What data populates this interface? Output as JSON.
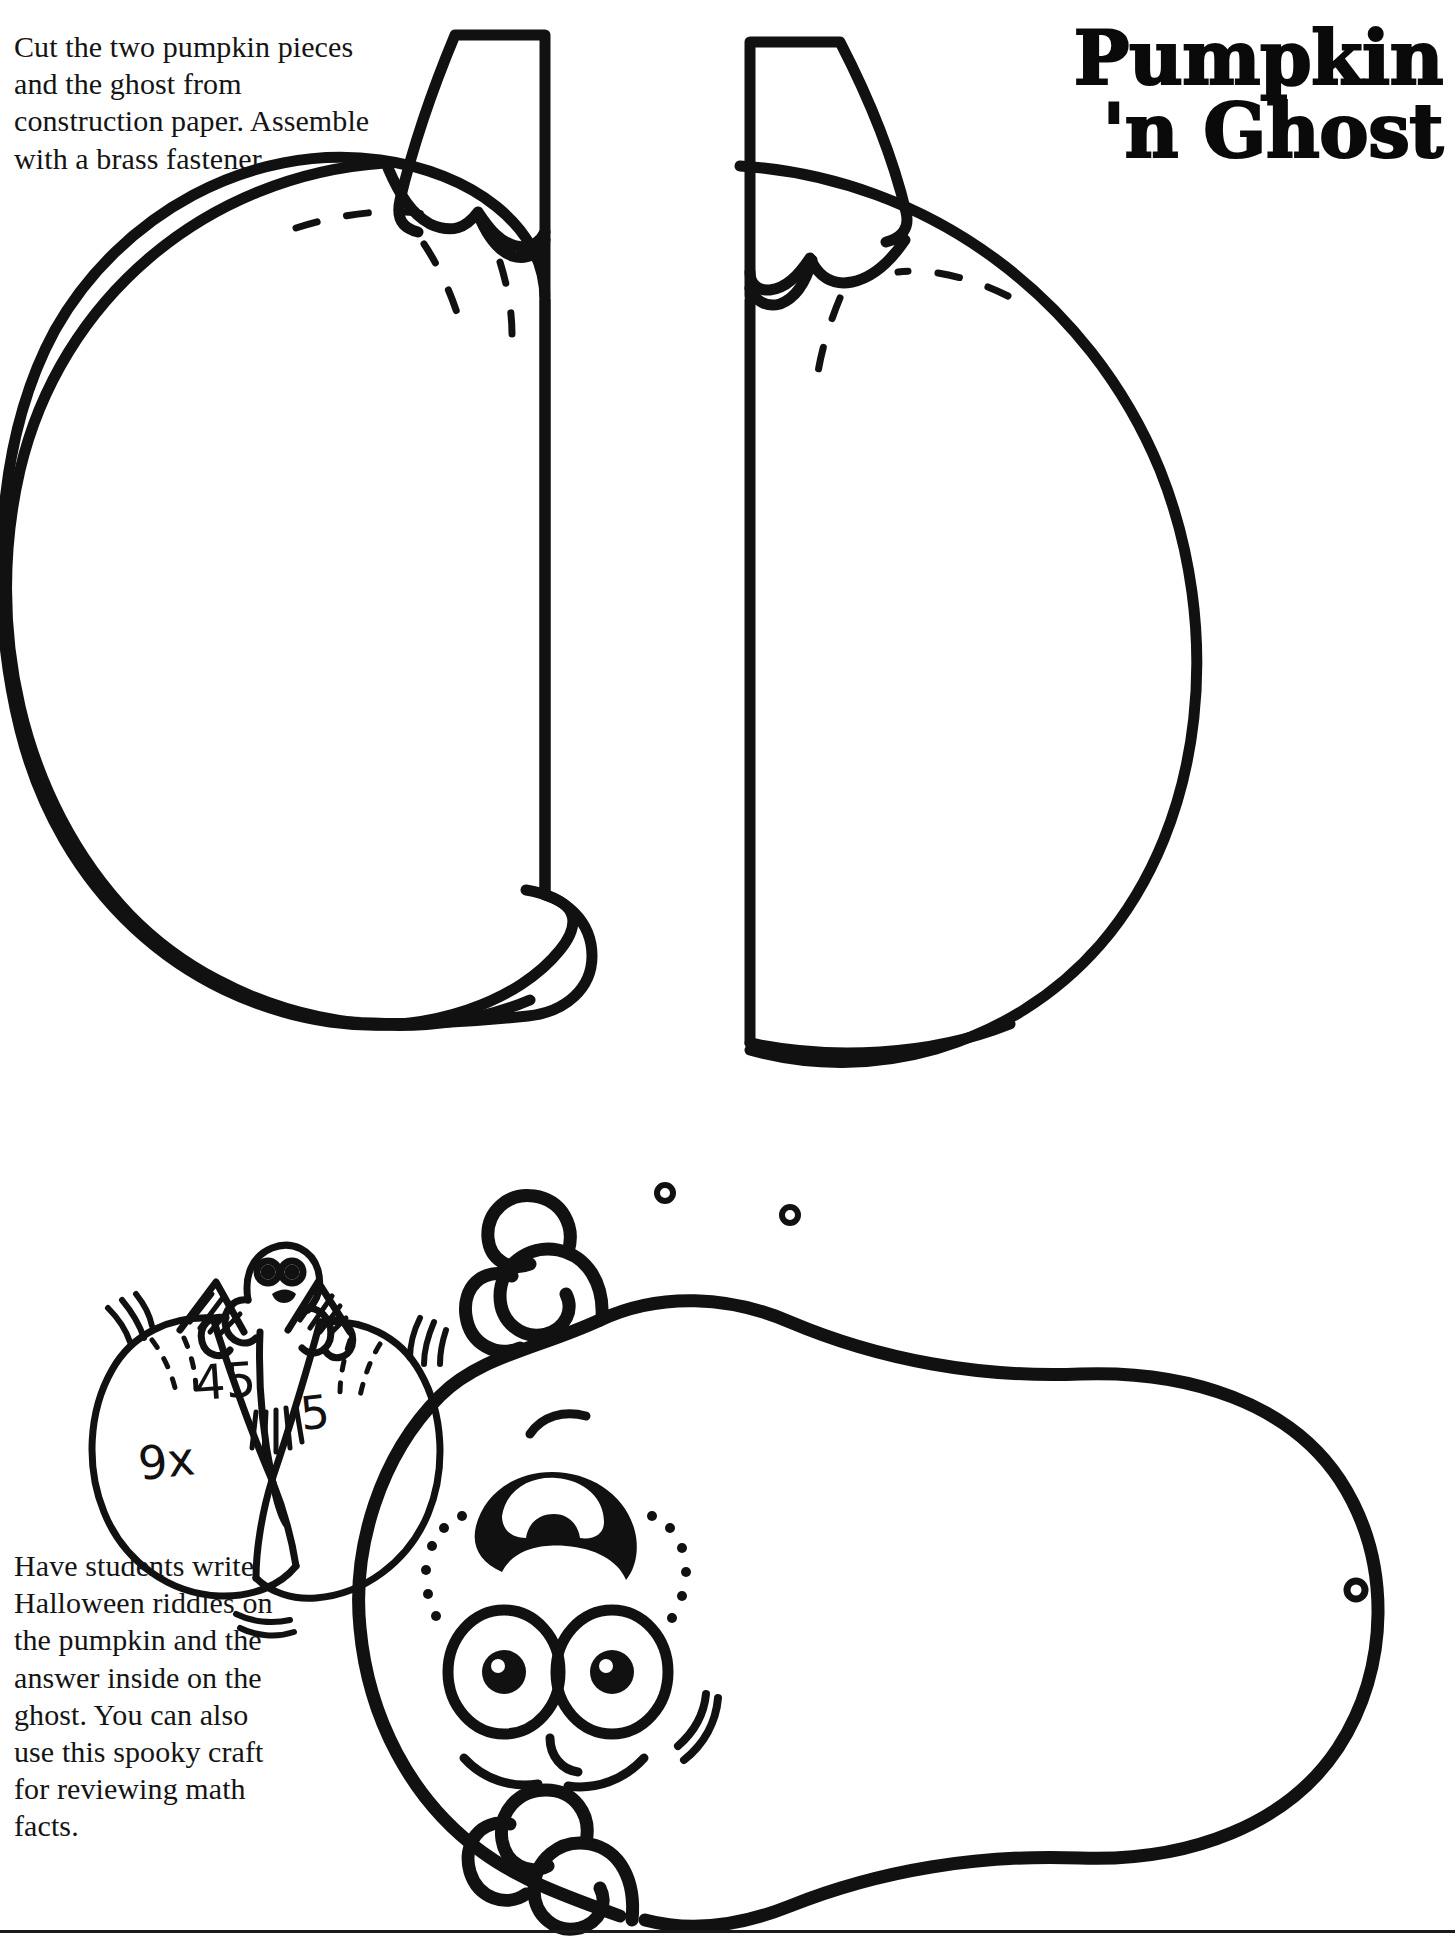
{
  "page": {
    "title_lines": [
      "Pumpkin",
      "'n Ghost"
    ],
    "background_color": "#ffffff",
    "ink_color": "#111111",
    "width": 1455,
    "height": 1947
  },
  "instructions": {
    "top": "Cut the two pumpkin pieces and the ghost from construction paper. Assemble with a brass fastener.",
    "bottom": "Have students write Halloween riddles on the pumpkin and the answer inside on the ghost. You can also use this spooky craft for reviewing math facts."
  },
  "artwork": {
    "pumpkin_template": {
      "name": "pumpkin-two-piece-template",
      "pieces": 2,
      "fastener_holes": 2
    },
    "ghost_template": {
      "name": "ghost-cutout-template",
      "fastener_holes": 1
    },
    "example_sketch": {
      "name": "pumpkin-ghost-math-example",
      "left_label": "9x",
      "center_label": "45",
      "right_label": "5"
    }
  }
}
